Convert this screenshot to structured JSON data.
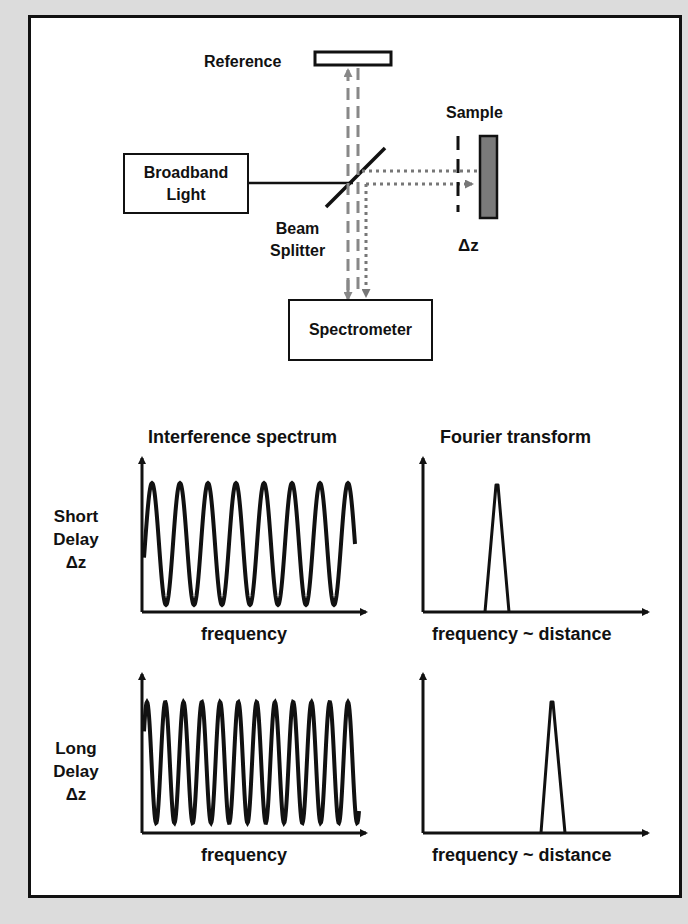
{
  "setup": {
    "reference_label": "Reference",
    "sample_label": "Sample",
    "light_source": [
      "Broadband",
      "Light"
    ],
    "beam_splitter": [
      "Beam",
      "Splitter"
    ],
    "delta_z": "Δz",
    "detector": "Spectrometer",
    "colors": {
      "reference_beam": "#888888",
      "sample_beam": "#777777",
      "sample_fill": "#7a7a7a",
      "frame": "#111111",
      "background": "#dcdcdc"
    }
  },
  "plots": {
    "col_titles": [
      "Interference spectrum",
      "Fourier transform"
    ],
    "rows": [
      {
        "label": [
          "Short",
          "Delay",
          "Δz"
        ],
        "spectrum_xlabel": "frequency",
        "ft_xlabel": "frequency ~ distance"
      },
      {
        "label": [
          "Long",
          "Delay",
          "Δz"
        ],
        "spectrum_xlabel": "frequency",
        "ft_xlabel": "frequency ~ distance"
      }
    ]
  },
  "chart_data": [
    {
      "type": "line",
      "title": "Interference spectrum",
      "row": "Short Delay Δz",
      "xlabel": "frequency",
      "ylabel": "",
      "description": "sinusoidal fringes",
      "visible_cycles": 8,
      "grid": false
    },
    {
      "type": "line",
      "title": "Fourier transform",
      "row": "Short Delay Δz",
      "xlabel": "frequency ~ distance",
      "ylabel": "",
      "description": "single narrow peak near left-center",
      "peak_position_fraction": 0.33,
      "grid": false
    },
    {
      "type": "line",
      "title": "Interference spectrum",
      "row": "Long Delay Δz",
      "xlabel": "frequency",
      "ylabel": "",
      "description": "denser sinusoidal fringes",
      "visible_cycles": 12,
      "grid": false
    },
    {
      "type": "line",
      "title": "Fourier transform",
      "row": "Long Delay Δz",
      "xlabel": "frequency ~ distance",
      "ylabel": "",
      "description": "single narrow peak further right",
      "peak_position_fraction": 0.58,
      "grid": false
    }
  ]
}
